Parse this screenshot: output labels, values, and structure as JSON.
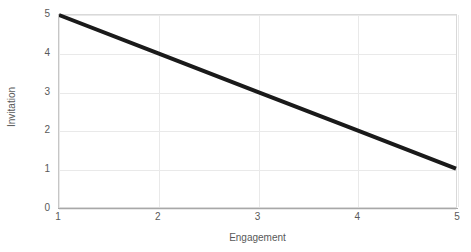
{
  "chart_data": {
    "type": "line",
    "title": "",
    "xlabel": "Engagement",
    "ylabel": "Invitation",
    "x": [
      1,
      2,
      3,
      4,
      5
    ],
    "series": [
      {
        "name": "Invitation",
        "values": [
          5,
          4,
          3,
          2,
          1
        ],
        "color": "#1a1a1a",
        "line_width": 4
      }
    ],
    "xlim": [
      1,
      5
    ],
    "ylim": [
      0,
      5
    ],
    "xticks": [
      1,
      2,
      3,
      4,
      5
    ],
    "yticks": [
      0,
      1,
      2,
      3,
      4,
      5
    ],
    "xtick_labels": [
      "1",
      "2",
      "3",
      "4",
      "5"
    ],
    "ytick_labels": [
      "0",
      "1",
      "2",
      "3",
      "4",
      "5"
    ],
    "grid": true,
    "grid_color": "#e9e9e9",
    "legend": false,
    "legend_position": "none",
    "annotations": [],
    "background_color": "#ffffff",
    "axis_color": "#c6c6c6",
    "tick_label_color": "#595959"
  }
}
